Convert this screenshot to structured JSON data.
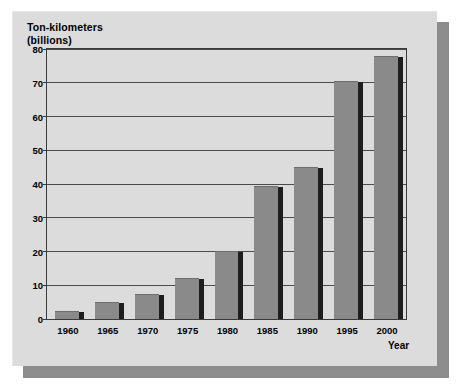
{
  "chart_data": {
    "type": "bar",
    "title": "Ton-kilometers (billions)",
    "title_lines": [
      "Ton-kilometers",
      "(billions)"
    ],
    "xlabel": "Year",
    "ylabel": "Ton-kilometers (billions)",
    "categories": [
      "1960",
      "1965",
      "1970",
      "1975",
      "1980",
      "1985",
      "1990",
      "1995",
      "2000"
    ],
    "values": [
      2.5,
      5.0,
      7.3,
      12.2,
      20.3,
      39.5,
      45.0,
      70.5,
      78.0
    ],
    "ylim": [
      0,
      80
    ],
    "yticks": [
      0,
      10,
      20,
      30,
      40,
      50,
      60,
      70,
      80
    ],
    "ytick_labels": [
      "0",
      "10",
      "20",
      "30",
      "40",
      "50",
      "60",
      "70",
      "80"
    ],
    "grid": true,
    "legend": false,
    "bar_style": "3d-shadowed",
    "colors": {
      "bar_face": "#8a8a8a",
      "bar_side": "#1e1e1e",
      "plot_background": "#dcdcdc",
      "panel_background": "#dcdcdc",
      "panel_shadow": "#8d8d8d",
      "axis": "#3a3a3a",
      "gridline": "#4a4a4a",
      "text": "#000000",
      "page_background": "#ffffff"
    }
  }
}
